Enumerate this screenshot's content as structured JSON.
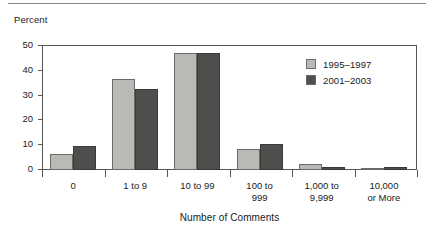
{
  "figure": {
    "y_axis_caption": "Percent",
    "x_axis_title": "Number of Comments"
  },
  "legend": {
    "entries": [
      {
        "label": "1995–1997",
        "color": "#b9b9b5",
        "swatch_name": "legend-swatch-1995-1997"
      },
      {
        "label": "2001–2003",
        "color": "#4e4e4c",
        "swatch_name": "legend-swatch-2001-2003"
      }
    ]
  },
  "chart_data": {
    "type": "bar",
    "title": "",
    "subtitle": "",
    "xlabel": "Number of Comments",
    "ylabel": "Percent",
    "categories": [
      "0",
      "1 to 9",
      "10 to 99",
      "100 to\n999",
      "1,000 to\n9,999",
      "10,000\nor More"
    ],
    "category_lines": [
      [
        "0"
      ],
      [
        "1 to 9"
      ],
      [
        "10 to 99"
      ],
      [
        "100 to",
        "999"
      ],
      [
        "1,000 to",
        "9,999"
      ],
      [
        "10,000",
        "or More"
      ]
    ],
    "series": [
      {
        "name": "1995–1997",
        "color": "#b9b9b5",
        "values": [
          6.3,
          36.5,
          47.2,
          8.5,
          2.3,
          1.0
        ]
      },
      {
        "name": "2001–2003",
        "color": "#4e4e4c",
        "values": [
          9.6,
          32.5,
          47.3,
          10.5,
          1.3,
          1.2
        ]
      }
    ],
    "ylim": [
      0,
      50
    ],
    "yticks": [
      0,
      10,
      20,
      30,
      40,
      50
    ],
    "ytick_labels": [
      "0",
      "10",
      "20",
      "30",
      "40",
      "50"
    ],
    "grid": false,
    "legend_position": "upper-right-inside"
  },
  "colors": {
    "series_a": "#b9b9b5",
    "series_b": "#4e4e4c",
    "axis": "#555555",
    "text": "#1a1a1a",
    "rule": "#8a8a8a"
  }
}
